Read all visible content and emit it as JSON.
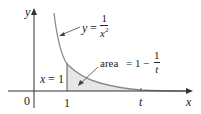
{
  "diagram": {
    "curve_label": {
      "lhs": "y",
      "eq": "=",
      "num": "1",
      "den": "x",
      "exp": "2"
    },
    "area_label": {
      "prefix": "area",
      "eq": "=",
      "one": "1",
      "minus": "−",
      "num": "1",
      "den": "t"
    },
    "line_label": {
      "var": "x",
      "eq": "=",
      "val": "1"
    },
    "axis_labels": {
      "x": "x",
      "y": "y",
      "origin": "0"
    },
    "tick_labels": {
      "one": "1",
      "t": "t"
    },
    "colors": {
      "curve": "#8a8a8a",
      "shade": "#e6e6e6",
      "axes": "#333333"
    }
  }
}
